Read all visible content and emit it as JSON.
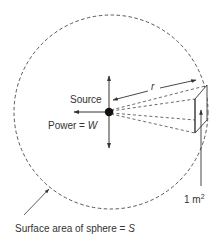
{
  "diagram": {
    "type": "physics-illustration",
    "labels": {
      "source": "Source",
      "power_prefix": "Power = ",
      "power_symbol": "W",
      "radius": "r",
      "area_unit": "1 m",
      "area_exponent": "2",
      "sphere_prefix": "Surface area of sphere = ",
      "sphere_symbol": "S"
    },
    "colors": {
      "line": "#333333",
      "dot": "#111111",
      "background": "#ffffff"
    },
    "geometry": {
      "sphere_center": [
        111,
        112
      ],
      "sphere_radius": 97,
      "source_point": [
        109,
        112
      ],
      "unit_area_patch": [
        [
          195,
          99
        ],
        [
          207,
          85
        ],
        [
          207,
          120
        ],
        [
          195,
          133
        ]
      ]
    }
  }
}
